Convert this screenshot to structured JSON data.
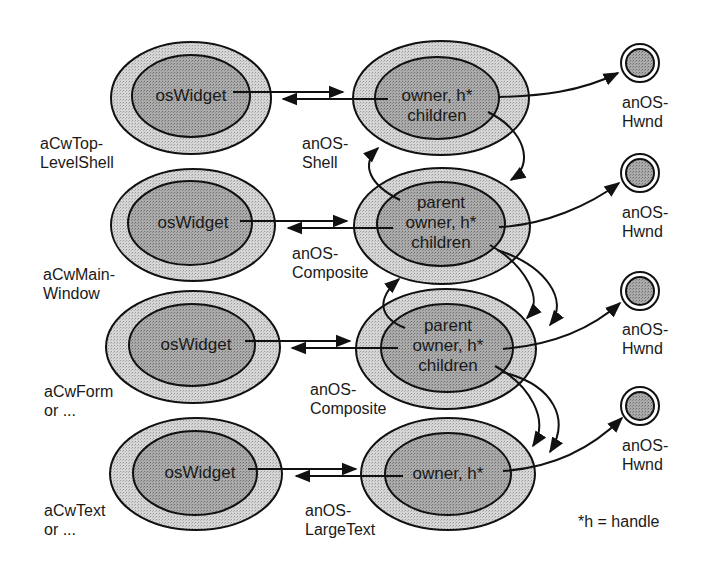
{
  "diagram": {
    "rows": [
      {
        "cw_label": "aCwTop-\nLevelShell",
        "widget_text": "osWidget",
        "os_label": "anOS-\nShell",
        "os_fields": "owner, h*\nchildren",
        "hwnd_label": "anOS-\nHwnd"
      },
      {
        "cw_label": "aCwMain-\nWindow",
        "widget_text": "osWidget",
        "os_label": "anOS-\nComposite",
        "os_fields": "parent\nowner, h*\nchildren",
        "hwnd_label": "anOS-\nHwnd"
      },
      {
        "cw_label": "aCwForm\nor ...",
        "widget_text": "osWidget",
        "os_label": "anOS-\nComposite",
        "os_fields": "parent\nowner, h*\nchildren",
        "hwnd_label": "anOS-\nHwnd"
      },
      {
        "cw_label": "aCwText\nor ...",
        "widget_text": "osWidget",
        "os_label": "anOS-\nLargeText",
        "os_fields": "owner, h*",
        "hwnd_label": "anOS-\nHwnd"
      }
    ],
    "legend": "*h = handle",
    "colors": {
      "outer_fill": "#d4d4d4",
      "inner_fill": "#a8a8a8",
      "stroke": "#111111",
      "background": "#ffffff"
    }
  }
}
